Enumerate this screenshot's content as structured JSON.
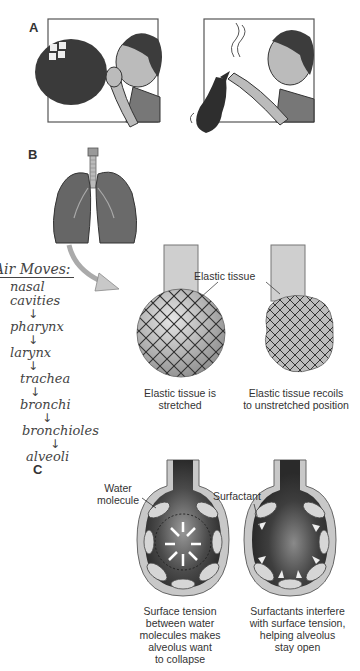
{
  "panels": {
    "a": {
      "label": "A"
    },
    "b": {
      "label": "B",
      "callout": "Elastic tissue",
      "captions": [
        "Elastic tissue is\nstretched",
        "Elastic tissue recoils\nto unstretched position"
      ]
    },
    "c": {
      "label": "C",
      "callouts": {
        "water": "Water\nmolecule",
        "surfactant": "Surfactant"
      },
      "captions": [
        "Surface tension\nbetween water\nmolecules makes\nalveolus want\nto collapse",
        "Surfactants interfere\nwith surface tension,\nhelping alveolus\nstay open"
      ]
    }
  },
  "handwritten_notes": {
    "title": "Air Moves:",
    "steps": [
      "nasal",
      "cavities",
      "pharynx",
      "larynx",
      "trachea",
      "bronchi",
      "bronchioles",
      "alveoli"
    ],
    "arrow_glyph": "↓"
  }
}
